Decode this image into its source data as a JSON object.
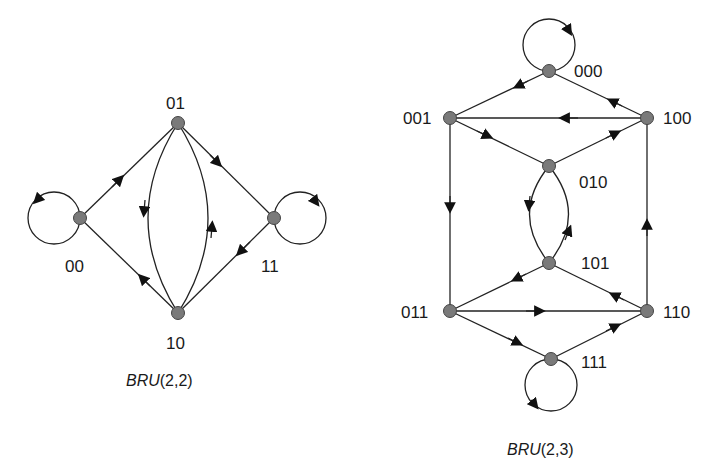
{
  "diagrams": [
    {
      "caption_italic": "BRU",
      "caption_rest": "(2,2)",
      "nodes": [
        "00",
        "01",
        "10",
        "11"
      ],
      "edges": [
        {
          "from": "00",
          "to": "00",
          "type": "self-loop"
        },
        {
          "from": "00",
          "to": "01"
        },
        {
          "from": "01",
          "to": "10"
        },
        {
          "from": "01",
          "to": "11"
        },
        {
          "from": "10",
          "to": "00"
        },
        {
          "from": "10",
          "to": "01"
        },
        {
          "from": "11",
          "to": "10"
        },
        {
          "from": "11",
          "to": "11",
          "type": "self-loop"
        }
      ]
    },
    {
      "caption_italic": "BRU",
      "caption_rest": "(2,3)",
      "nodes": [
        "000",
        "001",
        "010",
        "011",
        "100",
        "101",
        "110",
        "111"
      ],
      "edges": [
        {
          "from": "000",
          "to": "000",
          "type": "self-loop"
        },
        {
          "from": "000",
          "to": "001"
        },
        {
          "from": "100",
          "to": "000"
        },
        {
          "from": "100",
          "to": "001"
        },
        {
          "from": "001",
          "to": "010"
        },
        {
          "from": "010",
          "to": "100"
        },
        {
          "from": "001",
          "to": "011"
        },
        {
          "from": "010",
          "to": "101"
        },
        {
          "from": "101",
          "to": "010"
        },
        {
          "from": "110",
          "to": "100"
        },
        {
          "from": "101",
          "to": "011"
        },
        {
          "from": "110",
          "to": "101"
        },
        {
          "from": "011",
          "to": "110"
        },
        {
          "from": "011",
          "to": "111"
        },
        {
          "from": "111",
          "to": "110"
        },
        {
          "from": "111",
          "to": "111",
          "type": "self-loop"
        }
      ]
    }
  ],
  "labels": {
    "n00": "00",
    "n01": "01",
    "n10": "10",
    "n11": "11",
    "m000": "000",
    "m001": "001",
    "m010": "010",
    "m011": "011",
    "m100": "100",
    "m101": "101",
    "m110": "110",
    "m111": "111"
  },
  "captions": {
    "left_italic": "BRU",
    "left_rest": "(2,2)",
    "right_italic": "BRU",
    "right_rest": "(2,3)"
  }
}
